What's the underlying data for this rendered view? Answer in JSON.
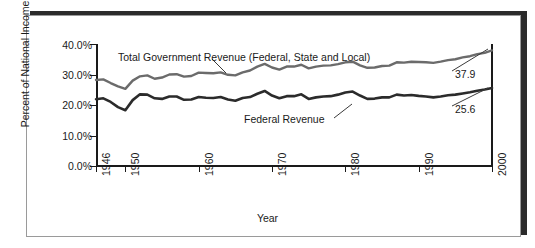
{
  "chart_data": {
    "type": "line",
    "title": "",
    "xlabel": "Year",
    "ylabel": "Percent of National Income",
    "xlim": [
      1946,
      2000
    ],
    "ylim": [
      0,
      40
    ],
    "grid": false,
    "legend_position": "inline-annotation",
    "xticks": [
      "1946",
      "1950",
      "1960",
      "1970",
      "1980",
      "1990",
      "2000"
    ],
    "xtick_values": [
      1946,
      1950,
      1960,
      1970,
      1980,
      1990,
      2000
    ],
    "yticks": [
      "0.0%",
      "10.0%",
      "20.0%",
      "30.0%",
      "40.0%"
    ],
    "ytick_values": [
      0,
      10,
      20,
      30,
      40
    ],
    "x": [
      1946,
      1947,
      1948,
      1949,
      1950,
      1951,
      1952,
      1953,
      1954,
      1955,
      1956,
      1957,
      1958,
      1959,
      1960,
      1961,
      1962,
      1963,
      1964,
      1965,
      1966,
      1967,
      1968,
      1969,
      1970,
      1971,
      1972,
      1973,
      1974,
      1975,
      1976,
      1977,
      1978,
      1979,
      1980,
      1981,
      1982,
      1983,
      1984,
      1985,
      1986,
      1987,
      1988,
      1989,
      1990,
      1991,
      1992,
      1993,
      1994,
      1995,
      1996,
      1997,
      1998,
      1999,
      2000
    ],
    "series": [
      {
        "name": "Total Government Revenue (Federal, State and Local)",
        "color": "#6b6b6b",
        "end_label": "37.9",
        "values": [
          28.2,
          28.4,
          27.2,
          26.1,
          25.3,
          28.0,
          29.4,
          29.7,
          28.6,
          29.0,
          30.0,
          30.1,
          29.3,
          29.5,
          30.6,
          30.5,
          30.4,
          30.7,
          29.9,
          29.7,
          30.7,
          31.3,
          32.6,
          33.5,
          32.3,
          31.6,
          32.6,
          32.6,
          33.2,
          32.0,
          32.6,
          32.9,
          33.0,
          33.4,
          34.0,
          34.2,
          33.0,
          32.2,
          32.3,
          32.8,
          32.9,
          34.0,
          33.9,
          34.2,
          34.1,
          34.0,
          33.8,
          34.2,
          34.7,
          35.0,
          35.6,
          36.0,
          36.7,
          37.1,
          37.9
        ]
      },
      {
        "name": "Federal Revenue",
        "color": "#2b2b2b",
        "end_label": "25.6",
        "values": [
          21.9,
          22.2,
          21.0,
          19.3,
          18.3,
          21.6,
          23.5,
          23.4,
          22.2,
          22.0,
          22.8,
          22.8,
          21.7,
          21.8,
          22.6,
          22.4,
          22.3,
          22.6,
          21.8,
          21.4,
          22.3,
          22.6,
          23.7,
          24.6,
          23.1,
          22.2,
          22.9,
          22.9,
          23.5,
          22.0,
          22.5,
          22.8,
          22.9,
          23.4,
          24.1,
          24.4,
          23.1,
          22.0,
          22.1,
          22.5,
          22.5,
          23.4,
          23.1,
          23.3,
          23.0,
          22.8,
          22.5,
          22.8,
          23.2,
          23.4,
          23.8,
          24.2,
          24.7,
          25.1,
          25.6
        ]
      }
    ],
    "annotations": [
      {
        "text": "Total Government Revenue (Federal, State and Local)"
      },
      {
        "text": "Federal Revenue"
      }
    ]
  }
}
